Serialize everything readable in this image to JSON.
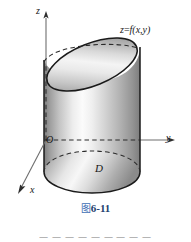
{
  "figure": {
    "caption_prefix": "图",
    "caption_number": "6-11",
    "surface_label": "z=f(x,y)",
    "surface_label_parts": {
      "z": "z",
      "eq": "=",
      "f": "f",
      "args": "(x,y)"
    },
    "region_label": "D",
    "origin_label": "O",
    "axes": [
      {
        "name": "x",
        "label": "x",
        "direction": "down-left"
      },
      {
        "name": "y",
        "label": "y",
        "direction": "right"
      },
      {
        "name": "z",
        "label": "z",
        "direction": "up"
      }
    ],
    "colors": {
      "outline": "#1a1a1a",
      "solid_light": "#fdfdfd",
      "solid_mid": "#c9c9c9",
      "solid_dark": "#8f8f8f",
      "dashed": "#2b2b2b",
      "axis": "#4a4a4a",
      "caption_cn": "#3f6fb5",
      "caption_num": "#23406e",
      "background": "#ffffff"
    }
  },
  "page_footer": {
    "text": "一 一 一 一 一 一 一 一 一"
  }
}
